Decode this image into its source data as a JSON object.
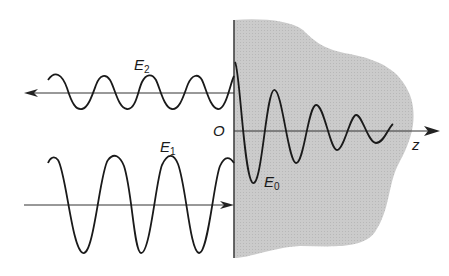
{
  "diagram": {
    "colors": {
      "medium_fill": "#c9c9c9",
      "line": "#1a1a1a",
      "axis": "#333333",
      "background": "#ffffff"
    },
    "labels": {
      "reflected": {
        "main": "E",
        "sub": "2"
      },
      "incident": {
        "main": "E",
        "sub": "1"
      },
      "transmitted": {
        "main": "E",
        "sub": "0"
      },
      "origin": "O",
      "axis": "z"
    },
    "waves": {
      "reflected": {
        "direction": "left",
        "axis_y": 93,
        "amplitude": 17,
        "period": 46
      },
      "incident": {
        "direction": "right",
        "axis_y": 205,
        "amplitude": 48,
        "period": 58
      },
      "transmitted": {
        "type": "damped",
        "axis_y": 131
      }
    }
  }
}
